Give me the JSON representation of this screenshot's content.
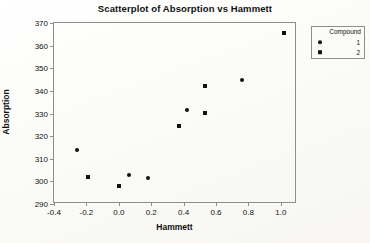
{
  "chart_data": {
    "type": "scatter",
    "title": "Scatterplot of Absorption vs Hammett",
    "xlabel": "Hammett",
    "ylabel": "Absorption",
    "xlim": [
      -0.4,
      1.1
    ],
    "ylim": [
      290,
      370
    ],
    "xticks": [
      -0.4,
      -0.2,
      0.0,
      0.2,
      0.4,
      0.6,
      0.8,
      1.0
    ],
    "xtick_labels": [
      "-0.4",
      "-0.2",
      "0.0",
      "0.2",
      "0.4",
      "0.6",
      "0.8",
      "1.0"
    ],
    "yticks": [
      290,
      300,
      310,
      320,
      330,
      340,
      350,
      360,
      370
    ],
    "ytick_labels": [
      "290",
      "300",
      "310",
      "320",
      "330",
      "340",
      "350",
      "360",
      "370"
    ],
    "grid": false,
    "legend_position": "right-outside",
    "legend_title": "Compound",
    "series": [
      {
        "name": "1",
        "marker": "circle",
        "color": "#111111",
        "points": [
          {
            "x": -0.26,
            "y": 314.0
          },
          {
            "x": 0.06,
            "y": 302.7
          },
          {
            "x": 0.18,
            "y": 301.5
          },
          {
            "x": 0.42,
            "y": 331.5
          },
          {
            "x": 0.76,
            "y": 345.0
          }
        ]
      },
      {
        "name": "2",
        "marker": "square",
        "color": "#111111",
        "points": [
          {
            "x": -0.19,
            "y": 302.0
          },
          {
            "x": 0.0,
            "y": 297.8
          },
          {
            "x": 0.37,
            "y": 324.5
          },
          {
            "x": 0.53,
            "y": 342.2
          },
          {
            "x": 0.53,
            "y": 330.2
          },
          {
            "x": 1.02,
            "y": 365.5
          }
        ]
      }
    ]
  }
}
